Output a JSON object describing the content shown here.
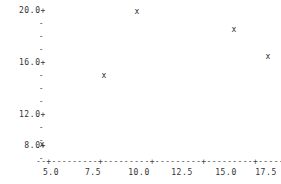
{
  "chart_data": {
    "type": "scatter",
    "title": "",
    "subtitle": "",
    "xlabel": "x",
    "ylabel": "",
    "style": "ascii-character-plot",
    "marker": "x",
    "grid": false,
    "legend": null,
    "xlim": [
      4.0,
      18.6
    ],
    "ylim": [
      7.6,
      20.4
    ],
    "x_ticks": [
      5.0,
      7.5,
      10.0,
      12.5,
      15.0,
      17.5
    ],
    "x_tick_labels": [
      "5.0",
      "7.5",
      "10.0",
      "12.5",
      "15.0",
      "17.5"
    ],
    "y_ticks": [
      8.0,
      12.0,
      16.0,
      20.0
    ],
    "y_tick_labels": [
      "8.0+",
      "12.0+",
      "16.0+",
      "20.0+"
    ],
    "y_minor_tick_mark": "-",
    "y_minor_ticks_per_interval": 3,
    "points": [
      {
        "x": 4.6,
        "y": 8.0,
        "marker": "x"
      },
      {
        "x": 8.1,
        "y": 14.7,
        "marker": "x"
      },
      {
        "x": 10.2,
        "y": 20.0,
        "marker": "x"
      },
      {
        "x": 16.3,
        "y": 18.3,
        "marker": "x"
      },
      {
        "x": 17.9,
        "y": 16.1,
        "marker": "x"
      }
    ],
    "axis_line_glyph": "-",
    "axis_tick_glyph": "+",
    "x_axis_end_label": "x"
  },
  "axes": {
    "y_major": [
      {
        "label": "20.0+",
        "top": 7
      },
      {
        "label": "16.0+",
        "top": 59
      },
      {
        "label": "12.0+",
        "top": 111
      },
      {
        "label": "8.0+",
        "top": 142
      }
    ],
    "y_minor": [
      {
        "label": "-",
        "top": 20
      },
      {
        "label": "-",
        "top": 33
      },
      {
        "label": "-",
        "top": 46
      },
      {
        "label": "-",
        "top": 72
      },
      {
        "label": "-",
        "top": 85
      },
      {
        "label": "-",
        "top": 98
      },
      {
        "label": "-",
        "top": 124
      },
      {
        "label": "-",
        "top": 137
      },
      {
        "label": "-",
        "top": 155
      }
    ],
    "x_axis_line": "--+---------+---------+---------+---------+---------+---x",
    "x_labels": [
      {
        "label": "5.0",
        "left": 51
      },
      {
        "label": "7.5",
        "left": 93
      },
      {
        "label": "10.0",
        "left": 139
      },
      {
        "label": "12.5",
        "left": 182
      },
      {
        "label": "15.0",
        "left": 226
      },
      {
        "label": "17.5",
        "left": 266
      }
    ]
  },
  "markers": [
    {
      "glyph": "x",
      "left": 42,
      "top": 145
    },
    {
      "glyph": "x",
      "left": 104,
      "top": 76
    },
    {
      "glyph": "x",
      "left": 137,
      "top": 12
    },
    {
      "glyph": "x",
      "left": 234,
      "top": 30
    },
    {
      "glyph": "x",
      "left": 268,
      "top": 57
    }
  ]
}
